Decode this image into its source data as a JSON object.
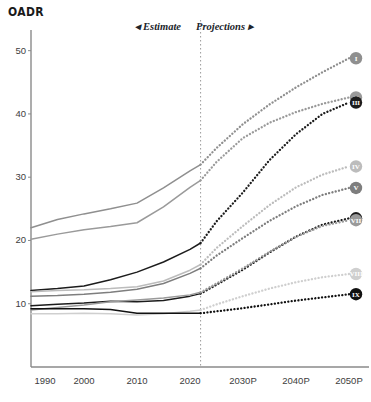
{
  "header": {
    "title": "OADR"
  },
  "bands": {
    "estimate_label": "◂ Estimate",
    "projections_label": "Projections ▸",
    "divider_year": 2022
  },
  "axes": {
    "y_ticks": [
      "10",
      "20",
      "30",
      "40",
      "50"
    ],
    "y_values": [
      10,
      20,
      30,
      40,
      50
    ],
    "x_ticks": [
      "1990",
      "2000",
      "2010",
      "2020",
      "2030P",
      "2040P",
      "2050P"
    ],
    "x_values": [
      1990,
      2000,
      2010,
      2020,
      2030,
      2040,
      2050
    ]
  },
  "markers": {
    "i": "I",
    "ii": "II",
    "iii": "III",
    "iv": "IV",
    "v": "V",
    "vi": "VI",
    "vii": "VII",
    "viii": "VIII",
    "ix": "IX"
  },
  "colors": {
    "axis": "#8a8a8a",
    "divider": "#9a9a9a",
    "text": "#1a1a1a",
    "dark": "#111111",
    "mid_dark": "#3a3a3a",
    "mid": "#7d7d7d",
    "light": "#a8a8a8",
    "lighter": "#c4c4c4"
  },
  "chart_data": {
    "type": "line",
    "title": "OADR",
    "xlabel": "",
    "ylabel": "",
    "xlim": [
      1990,
      2050
    ],
    "ylim": [
      0,
      52
    ],
    "grid": false,
    "legend": "right-markers",
    "estimate_range": [
      1990,
      2022
    ],
    "projection_range": [
      2022,
      2050
    ],
    "x": [
      1990,
      1995,
      2000,
      2005,
      2010,
      2015,
      2020,
      2022,
      2025,
      2030,
      2035,
      2040,
      2045,
      2050
    ],
    "series": [
      {
        "name": "I",
        "marker": "I",
        "color": "#8f8f8f",
        "style": "solid-then-dotted",
        "values": [
          22.0,
          23.3,
          24.2,
          25.0,
          25.9,
          28.3,
          31.0,
          32.0,
          34.6,
          38.4,
          41.5,
          44.2,
          46.6,
          48.8
        ]
      },
      {
        "name": "II",
        "marker": "II",
        "color": "#9a9a9a",
        "style": "solid-then-dotted",
        "values": [
          20.2,
          21.0,
          21.7,
          22.2,
          22.8,
          25.3,
          28.4,
          29.5,
          32.4,
          36.2,
          38.6,
          40.3,
          41.6,
          42.6
        ]
      },
      {
        "name": "III",
        "marker": "III",
        "color": "#1c1c1c",
        "style": "solid-then-dotted",
        "values": [
          12.1,
          12.4,
          12.8,
          13.8,
          15.0,
          16.6,
          18.6,
          19.6,
          23.0,
          27.6,
          32.7,
          36.8,
          40.0,
          41.8
        ]
      },
      {
        "name": "IV",
        "marker": "IV",
        "color": "#bcbcbc",
        "style": "solid-then-dotted",
        "values": [
          11.9,
          12.1,
          12.2,
          12.4,
          12.7,
          13.6,
          15.3,
          16.2,
          18.8,
          22.3,
          25.6,
          28.4,
          30.4,
          31.7
        ]
      },
      {
        "name": "V",
        "marker": "V",
        "color": "#7e7e7e",
        "style": "solid-then-dotted",
        "values": [
          11.2,
          11.3,
          11.5,
          11.8,
          12.3,
          13.2,
          14.8,
          15.6,
          17.6,
          20.4,
          23.1,
          25.4,
          27.2,
          28.3
        ]
      },
      {
        "name": "VI",
        "marker": "VI",
        "color": "#1c1c1c",
        "style": "solid-then-dotted",
        "values": [
          9.7,
          9.9,
          10.1,
          10.4,
          10.3,
          10.5,
          11.2,
          11.6,
          13.0,
          15.4,
          18.1,
          20.6,
          22.5,
          23.5
        ]
      },
      {
        "name": "VII",
        "marker": "VII",
        "color": "#9a9a9a",
        "style": "solid-then-dotted",
        "values": [
          9.0,
          9.4,
          9.8,
          10.3,
          10.6,
          10.9,
          11.4,
          11.8,
          13.2,
          15.6,
          18.2,
          20.6,
          22.3,
          23.2
        ]
      },
      {
        "name": "VIII",
        "marker": "VIII",
        "color": "#cfcfcf",
        "style": "solid-then-dotted",
        "values": [
          8.4,
          8.4,
          8.5,
          8.4,
          8.2,
          8.4,
          8.8,
          9.0,
          9.9,
          11.2,
          12.4,
          13.4,
          14.2,
          14.7
        ]
      },
      {
        "name": "IX",
        "marker": "IX",
        "color": "#111111",
        "style": "solid-then-dotted",
        "values": [
          9.2,
          9.2,
          9.2,
          9.1,
          8.5,
          8.5,
          8.5,
          8.5,
          8.8,
          9.3,
          9.9,
          10.5,
          11.0,
          11.5
        ]
      }
    ]
  }
}
